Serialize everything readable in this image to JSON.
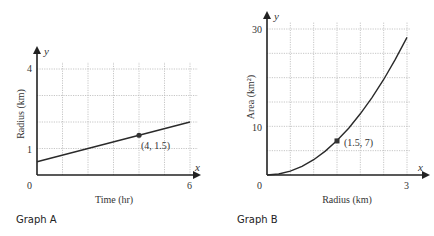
{
  "chart_data": [
    {
      "type": "line",
      "caption": "Graph A",
      "title": "",
      "xlabel": "Time (hr)",
      "ylabel": "Radius (km)",
      "x_axis_symbol": "x",
      "y_axis_symbol": "y",
      "origin_label": "0",
      "x_tick_labels": [
        {
          "value": 6,
          "label": "6"
        }
      ],
      "y_tick_labels": [
        {
          "value": 1,
          "label": "1"
        },
        {
          "value": 4,
          "label": "4"
        }
      ],
      "xlim": [
        0,
        6
      ],
      "ylim": [
        0,
        4
      ],
      "grid": true,
      "grid_x_step": 1,
      "grid_y_step": 1,
      "series": [
        {
          "name": "radius",
          "x": [
            0,
            6
          ],
          "y": [
            0.5,
            2.0
          ]
        }
      ],
      "highlight_point": {
        "x": 4,
        "y": 1.5,
        "label": "(4, 1.5)",
        "marker": "circle"
      }
    },
    {
      "type": "line",
      "caption": "Graph B",
      "title": "",
      "xlabel": "Radius (km)",
      "ylabel": "Area (km²)",
      "x_axis_symbol": "x",
      "y_axis_symbol": "y",
      "origin_label": "0",
      "x_tick_labels": [
        {
          "value": 3,
          "label": "3"
        }
      ],
      "y_tick_labels": [
        {
          "value": 10,
          "label": "10"
        },
        {
          "value": 30,
          "label": "30"
        }
      ],
      "xlim": [
        0,
        3
      ],
      "ylim": [
        0,
        30
      ],
      "grid": true,
      "grid_x_step": 0.5,
      "grid_y_step": 5,
      "series": [
        {
          "name": "area",
          "x": [
            0,
            0.25,
            0.5,
            0.75,
            1.0,
            1.25,
            1.5,
            1.75,
            2.0,
            2.25,
            2.5,
            2.75,
            3.0
          ],
          "y": [
            0,
            0.2,
            0.79,
            1.77,
            3.14,
            4.91,
            7.07,
            9.62,
            12.57,
            15.9,
            19.63,
            23.76,
            28.27
          ]
        }
      ],
      "highlight_point": {
        "x": 1.5,
        "y": 7,
        "label": "(1.5, 7)",
        "marker": "square"
      }
    }
  ],
  "graphA": {
    "caption": "Graph A",
    "xlabel": "Time (hr)",
    "ylabel": "Radius (km)",
    "x_sym": "x",
    "y_sym": "y",
    "origin": "0",
    "x_tick": "6",
    "y_tick_low": "1",
    "y_tick_high": "4",
    "point_label": "(4, 1.5)"
  },
  "graphB": {
    "caption": "Graph B",
    "xlabel": "Radius (km)",
    "ylabel": "Area (km²)",
    "x_sym": "x",
    "y_sym": "y",
    "origin": "0",
    "x_tick": "3",
    "y_tick_low": "10",
    "y_tick_high": "30",
    "point_label": "(1.5, 7)"
  }
}
